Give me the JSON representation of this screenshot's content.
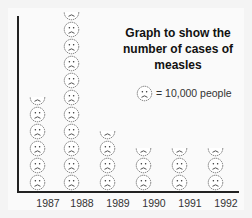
{
  "chart_data": {
    "type": "bar",
    "subtype": "pictograph",
    "title": "Graph to show the number of cases of measles",
    "xlabel": "",
    "ylabel": "",
    "categories": [
      "1987",
      "1988",
      "1989",
      "1990",
      "1991",
      "1992"
    ],
    "icon_counts": [
      5.5,
      10.5,
      3.5,
      2.5,
      2.5,
      2.5
    ],
    "values": [
      55000,
      105000,
      35000,
      25000,
      25000,
      25000
    ],
    "icon": "sad-face",
    "icon_value": 10000,
    "legend": {
      "label": "= 10,000 people",
      "position": "right"
    },
    "grid": false
  },
  "title": "Graph to show the number of cases of measles",
  "legend": {
    "label": "= 10,000 people"
  },
  "xticks": [
    "1987",
    "1988",
    "1989",
    "1990",
    "1991",
    "1992"
  ]
}
